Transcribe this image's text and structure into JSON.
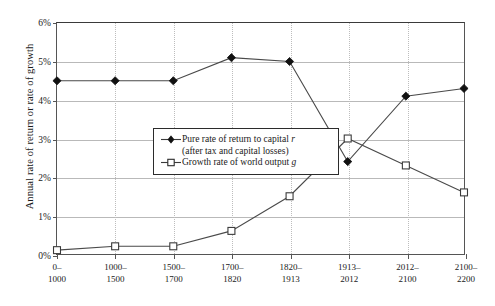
{
  "chart_data": {
    "type": "line",
    "title": "",
    "xlabel": "",
    "ylabel": "Annual rate of return or rate of growth",
    "categories": [
      "0–\n1000",
      "1000–\n1500",
      "1500–\n1700",
      "1700–\n1820",
      "1820–\n1913",
      "1913–\n2012",
      "2012–\n2100",
      "2100–\n2200"
    ],
    "category_lines": [
      [
        "0–",
        "1000"
      ],
      [
        "1000–",
        "1500"
      ],
      [
        "1500–",
        "1700"
      ],
      [
        "1700–",
        "1820"
      ],
      [
        "1820–",
        "1913"
      ],
      [
        "1913–",
        "2012"
      ],
      [
        "2012–",
        "2100"
      ],
      [
        "2100–",
        "2200"
      ]
    ],
    "ylim": [
      0,
      6
    ],
    "yticks": [
      0,
      1,
      2,
      3,
      4,
      5,
      6
    ],
    "ytick_labels": [
      "0%",
      "1%",
      "2%",
      "3%",
      "4%",
      "5%",
      "6%"
    ],
    "grid": "horizontal-and-vertical",
    "legend_position": "inside-left-middle",
    "series": [
      {
        "name": "Pure rate of return to capital r",
        "name_line1": "Pure rate of return to capital",
        "name_symbol1": "r",
        "name_line2": "(after tax and capital losses)",
        "marker": "filled-diamond",
        "values": [
          4.5,
          4.5,
          4.5,
          5.1,
          5.0,
          2.4,
          4.1,
          4.3
        ]
      },
      {
        "name": "Growth rate of world output g",
        "name_line1": "Growth rate of world output",
        "name_symbol1": "g",
        "marker": "open-square",
        "values": [
          0.1,
          0.2,
          0.2,
          0.6,
          1.5,
          3.0,
          2.3,
          1.6
        ]
      }
    ]
  }
}
